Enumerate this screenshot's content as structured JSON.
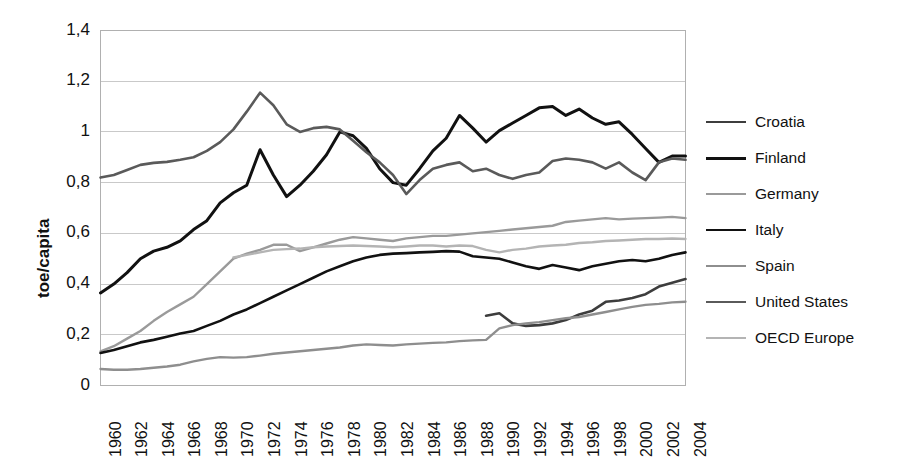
{
  "chart_data": {
    "type": "line",
    "title": "",
    "xlabel": "",
    "ylabel": "toe/capita",
    "ylim": [
      0,
      1.4
    ],
    "ytick_step": 0.2,
    "ytick_labels": [
      "1,4",
      "1,2",
      "1",
      "0,8",
      "0,6",
      "0,4",
      "0,2",
      "0"
    ],
    "ytick_values": [
      1.4,
      1.2,
      1.0,
      0.8,
      0.6,
      0.4,
      0.2,
      0
    ],
    "grid": true,
    "grid_axis": "y",
    "legend_position": "right",
    "decimal_separator": ",",
    "xlim": [
      1960,
      2004
    ],
    "x": [
      1960,
      1961,
      1962,
      1963,
      1964,
      1965,
      1966,
      1967,
      1968,
      1969,
      1970,
      1971,
      1972,
      1973,
      1974,
      1975,
      1976,
      1977,
      1978,
      1979,
      1980,
      1981,
      1982,
      1983,
      1984,
      1985,
      1986,
      1987,
      1988,
      1989,
      1990,
      1991,
      1992,
      1993,
      1994,
      1995,
      1996,
      1997,
      1998,
      1999,
      2000,
      2001,
      2002,
      2003,
      2004
    ],
    "xtick_labels": [
      "1960",
      "1962",
      "1964",
      "1966",
      "1968",
      "1970",
      "1972",
      "1974",
      "1976",
      "1978",
      "1980",
      "1982",
      "1984",
      "1986",
      "1988",
      "1990",
      "1992",
      "1994",
      "1996",
      "1998",
      "2000",
      "2002",
      "2004"
    ],
    "series": [
      {
        "name": "Croatia",
        "color": "#3d3d3d",
        "width": 2.6,
        "x": [
          1989,
          1990,
          1991,
          1992,
          1993,
          1994,
          1995,
          1996,
          1997,
          1998,
          1999,
          2000,
          2001,
          2002,
          2003,
          2004
        ],
        "values": [
          0.275,
          0.285,
          0.245,
          0.235,
          0.238,
          0.245,
          0.258,
          0.28,
          0.295,
          0.33,
          0.335,
          0.345,
          0.36,
          0.39,
          0.405,
          0.42
        ]
      },
      {
        "name": "Finland",
        "color": "#111111",
        "width": 3.0,
        "x": [
          1960,
          1961,
          1962,
          1963,
          1964,
          1965,
          1966,
          1967,
          1968,
          1969,
          1970,
          1971,
          1972,
          1973,
          1974,
          1975,
          1976,
          1977,
          1978,
          1979,
          1980,
          1981,
          1982,
          1983,
          1984,
          1985,
          1986,
          1987,
          1988,
          1989,
          1990,
          1991,
          1992,
          1993,
          1994,
          1995,
          1996,
          1997,
          1998,
          1999,
          2000,
          2001,
          2002,
          2003,
          2004
        ],
        "values": [
          0.365,
          0.4,
          0.445,
          0.5,
          0.53,
          0.545,
          0.57,
          0.615,
          0.65,
          0.72,
          0.76,
          0.79,
          0.93,
          0.83,
          0.745,
          0.79,
          0.845,
          0.91,
          1.0,
          0.985,
          0.935,
          0.855,
          0.8,
          0.79,
          0.855,
          0.925,
          0.975,
          1.065,
          1.015,
          0.96,
          1.005,
          1.035,
          1.065,
          1.095,
          1.1,
          1.065,
          1.09,
          1.055,
          1.03,
          1.04,
          0.99,
          0.935,
          0.88,
          0.905,
          0.905
        ]
      },
      {
        "name": "Germany",
        "color": "#9a9a9a",
        "width": 2.4,
        "x": [
          1960,
          1961,
          1962,
          1963,
          1964,
          1965,
          1966,
          1967,
          1968,
          1969,
          1970,
          1971,
          1972,
          1973,
          1974,
          1975,
          1976,
          1977,
          1978,
          1979,
          1980,
          1981,
          1982,
          1983,
          1984,
          1985,
          1986,
          1987,
          1988,
          1989,
          1990,
          1991,
          1992,
          1993,
          1994,
          1995,
          1996,
          1997,
          1998,
          1999,
          2000,
          2001,
          2002,
          2003,
          2004
        ],
        "values": [
          0.135,
          0.155,
          0.185,
          0.215,
          0.255,
          0.29,
          0.32,
          0.35,
          0.4,
          0.45,
          0.5,
          0.52,
          0.535,
          0.555,
          0.555,
          0.53,
          0.545,
          0.56,
          0.575,
          0.585,
          0.58,
          0.575,
          0.57,
          0.58,
          0.585,
          0.59,
          0.59,
          0.595,
          0.6,
          0.605,
          0.61,
          0.615,
          0.62,
          0.625,
          0.63,
          0.645,
          0.65,
          0.655,
          0.66,
          0.655,
          0.658,
          0.66,
          0.662,
          0.665,
          0.66
        ]
      },
      {
        "name": "Italy",
        "color": "#111111",
        "width": 2.6,
        "x": [
          1960,
          1961,
          1962,
          1963,
          1964,
          1965,
          1966,
          1967,
          1968,
          1969,
          1970,
          1971,
          1972,
          1973,
          1974,
          1975,
          1976,
          1977,
          1978,
          1979,
          1980,
          1981,
          1982,
          1983,
          1984,
          1985,
          1986,
          1987,
          1988,
          1989,
          1990,
          1991,
          1992,
          1993,
          1994,
          1995,
          1996,
          1997,
          1998,
          1999,
          2000,
          2001,
          2002,
          2003,
          2004
        ],
        "values": [
          0.128,
          0.14,
          0.155,
          0.17,
          0.18,
          0.192,
          0.205,
          0.215,
          0.235,
          0.255,
          0.28,
          0.3,
          0.325,
          0.35,
          0.375,
          0.4,
          0.425,
          0.45,
          0.47,
          0.49,
          0.505,
          0.515,
          0.52,
          0.522,
          0.525,
          0.527,
          0.53,
          0.528,
          0.51,
          0.505,
          0.5,
          0.485,
          0.47,
          0.46,
          0.475,
          0.465,
          0.455,
          0.47,
          0.48,
          0.49,
          0.495,
          0.49,
          0.5,
          0.515,
          0.525
        ]
      },
      {
        "name": "Spain",
        "color": "#8e8e8e",
        "width": 2.4,
        "x": [
          1960,
          1961,
          1962,
          1963,
          1964,
          1965,
          1966,
          1967,
          1968,
          1969,
          1970,
          1971,
          1972,
          1973,
          1974,
          1975,
          1976,
          1977,
          1978,
          1979,
          1980,
          1981,
          1982,
          1983,
          1984,
          1985,
          1986,
          1987,
          1988,
          1989,
          1990,
          1991,
          1992,
          1993,
          1994,
          1995,
          1996,
          1997,
          1998,
          1999,
          2000,
          2001,
          2002,
          2003,
          2004
        ],
        "values": [
          0.065,
          0.062,
          0.062,
          0.065,
          0.07,
          0.075,
          0.082,
          0.095,
          0.105,
          0.112,
          0.11,
          0.112,
          0.118,
          0.125,
          0.13,
          0.135,
          0.14,
          0.145,
          0.15,
          0.158,
          0.162,
          0.16,
          0.158,
          0.162,
          0.165,
          0.168,
          0.17,
          0.175,
          0.178,
          0.18,
          0.225,
          0.238,
          0.245,
          0.25,
          0.258,
          0.265,
          0.27,
          0.28,
          0.29,
          0.3,
          0.31,
          0.318,
          0.322,
          0.328,
          0.33
        ]
      },
      {
        "name": "United States",
        "color": "#5a5a5a",
        "width": 2.6,
        "x": [
          1960,
          1961,
          1962,
          1963,
          1964,
          1965,
          1966,
          1967,
          1968,
          1969,
          1970,
          1971,
          1972,
          1973,
          1974,
          1975,
          1976,
          1977,
          1978,
          1979,
          1980,
          1981,
          1982,
          1983,
          1984,
          1985,
          1986,
          1987,
          1988,
          1989,
          1990,
          1991,
          1992,
          1993,
          1994,
          1995,
          1996,
          1997,
          1998,
          1999,
          2000,
          2001,
          2002,
          2003,
          2004
        ],
        "values": [
          0.82,
          0.83,
          0.85,
          0.87,
          0.878,
          0.882,
          0.89,
          0.9,
          0.925,
          0.96,
          1.01,
          1.08,
          1.155,
          1.105,
          1.03,
          1.0,
          1.015,
          1.02,
          1.01,
          0.965,
          0.92,
          0.88,
          0.83,
          0.755,
          0.81,
          0.855,
          0.87,
          0.88,
          0.845,
          0.855,
          0.83,
          0.815,
          0.83,
          0.84,
          0.885,
          0.895,
          0.89,
          0.88,
          0.855,
          0.88,
          0.84,
          0.81,
          0.88,
          0.895,
          0.89
        ]
      },
      {
        "name": "OECD Europe",
        "color": "#b4b4b4",
        "width": 2.4,
        "x": [
          1970,
          1971,
          1972,
          1973,
          1974,
          1975,
          1976,
          1977,
          1978,
          1979,
          1980,
          1981,
          1982,
          1983,
          1984,
          1985,
          1986,
          1987,
          1988,
          1989,
          1990,
          1991,
          1992,
          1993,
          1994,
          1995,
          1996,
          1997,
          1998,
          1999,
          2000,
          2001,
          2002,
          2003,
          2004
        ],
        "values": [
          0.505,
          0.515,
          0.525,
          0.535,
          0.538,
          0.54,
          0.545,
          0.548,
          0.55,
          0.552,
          0.55,
          0.548,
          0.545,
          0.548,
          0.552,
          0.552,
          0.548,
          0.552,
          0.55,
          0.535,
          0.525,
          0.535,
          0.54,
          0.548,
          0.552,
          0.555,
          0.562,
          0.565,
          0.57,
          0.572,
          0.575,
          0.578,
          0.578,
          0.58,
          0.578
        ]
      }
    ]
  },
  "legend": {
    "items": [
      {
        "label": "Croatia"
      },
      {
        "label": "Finland"
      },
      {
        "label": "Germany"
      },
      {
        "label": "Italy"
      },
      {
        "label": "Spain"
      },
      {
        "label": "United States"
      },
      {
        "label": "OECD Europe"
      }
    ]
  }
}
